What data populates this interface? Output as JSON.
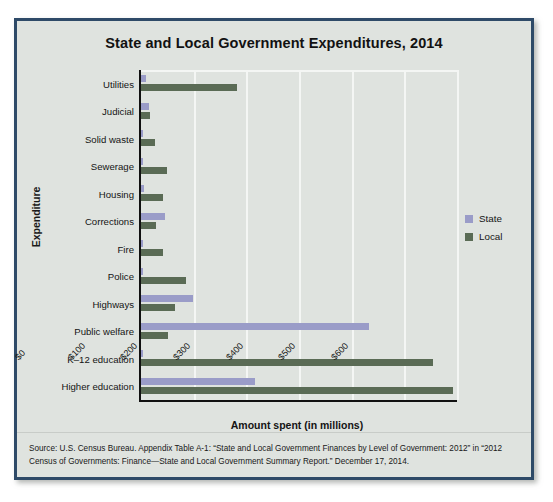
{
  "figure": {
    "title": "State and Local Government Expenditures, 2014",
    "source": "Source: U.S. Census Bureau. Appendix Table A-1: “State and Local Government Finances by Level of Government: 2012” in “2012 Census of Governments: Finance—State and Local Government Summary Report.” December 17, 2014.",
    "border_color": "#2e4a68",
    "background_color": "#dfe3df"
  },
  "legend": {
    "position": "right",
    "entries": [
      {
        "label": "State",
        "color": "#9a9cc8"
      },
      {
        "label": "Local",
        "color": "#5a6b55"
      }
    ]
  },
  "chart_data": {
    "type": "bar",
    "orientation": "horizontal",
    "title": "State and Local Government Expenditures, 2014",
    "xlabel": "Amount spent (in millions)",
    "ylabel": "Expenditure",
    "xlim": [
      0,
      600
    ],
    "xticks": [
      0,
      100,
      200,
      300,
      400,
      500,
      600
    ],
    "xtick_labels": [
      "$0",
      "$100",
      "$200",
      "$300",
      "$400",
      "$500",
      "$600"
    ],
    "grid": true,
    "categories": [
      "Utilities",
      "Judicial",
      "Solid waste",
      "Sewerage",
      "Housing",
      "Corrections",
      "Fire",
      "Police",
      "Highways",
      "Public welfare",
      "K–12 education",
      "Higher education"
    ],
    "series": [
      {
        "name": "State",
        "color": "#9a9cc8",
        "values": [
          10,
          16,
          0,
          0,
          6,
          45,
          0,
          2,
          98,
          432,
          4,
          217
        ]
      },
      {
        "name": "Local",
        "color": "#5a6b55",
        "values": [
          182,
          18,
          26,
          50,
          42,
          28,
          42,
          85,
          64,
          51,
          555,
          592
        ]
      }
    ]
  }
}
